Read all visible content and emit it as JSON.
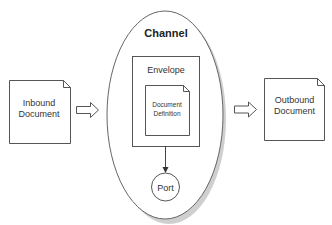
{
  "diagram": {
    "channel": {
      "label": "Channel"
    },
    "envelope": {
      "label": "Envelope"
    },
    "document_definition": {
      "line1": "Document",
      "line2": "Definition"
    },
    "port": {
      "label": "Port"
    },
    "inbound": {
      "line1": "Inbound",
      "line2": "Document"
    },
    "outbound": {
      "line1": "Outbound",
      "line2": "Document"
    }
  },
  "colors": {
    "stroke": "#555555",
    "shadow": "#9a9a9a",
    "background": "#ffffff"
  }
}
